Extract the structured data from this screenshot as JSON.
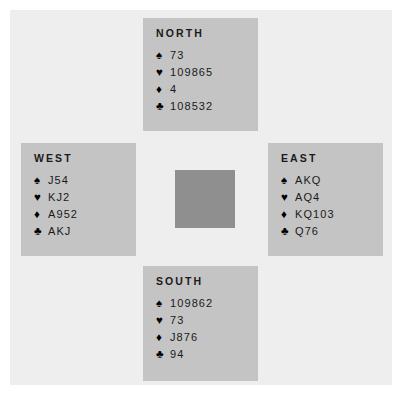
{
  "diagram": {
    "board_color": "#eeeeee",
    "panel_color": "#c4c4c4",
    "center_color": "#8f8f8f",
    "text_color": "#1a1a1a"
  },
  "suits": {
    "spade": {
      "name": "spade-suit-symbol",
      "glyph": "♠"
    },
    "heart": {
      "name": "heart-suit-symbol",
      "glyph": "♥"
    },
    "diamond": {
      "name": "diamond-suit-symbol",
      "glyph": "♦"
    },
    "club": {
      "name": "club-suit-symbol",
      "glyph": "♣"
    }
  },
  "hands": {
    "north": {
      "label": "NORTH",
      "spades": "73",
      "hearts": "109865",
      "diamonds": "4",
      "clubs": "108532"
    },
    "west": {
      "label": "WEST",
      "spades": "J54",
      "hearts": "KJ2",
      "diamonds": "A952",
      "clubs": "AKJ"
    },
    "east": {
      "label": "EAST",
      "spades": "AKQ",
      "hearts": "AQ4",
      "diamonds": "KQ103",
      "clubs": "Q76"
    },
    "south": {
      "label": "SOUTH",
      "spades": "109862",
      "hearts": "73",
      "diamonds": "J876",
      "clubs": "94"
    }
  }
}
